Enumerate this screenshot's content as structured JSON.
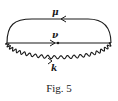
{
  "figure": {
    "caption": "Fig. 5",
    "lines": [
      {
        "id": "mu",
        "label": "μ",
        "kind": "fermion",
        "direction": "left"
      },
      {
        "id": "nu",
        "label": "ν",
        "kind": "fermion",
        "direction": "right"
      },
      {
        "id": "k",
        "label": "k",
        "kind": "photon-wavy",
        "direction": "right"
      }
    ]
  }
}
